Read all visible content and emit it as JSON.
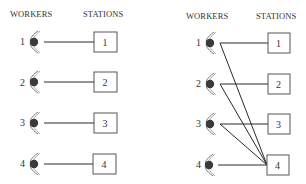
{
  "panels": [
    {
      "id": "left",
      "header_workers": "WORKERS",
      "header_stations": "STATIONS",
      "workers": [
        "1",
        "2",
        "3",
        "4"
      ],
      "stations": [
        "1",
        "2",
        "3",
        "4"
      ],
      "connections": [
        [
          1,
          1
        ],
        [
          2,
          2
        ],
        [
          3,
          3
        ],
        [
          4,
          4
        ]
      ]
    },
    {
      "id": "right",
      "header_workers": "WORKERS",
      "header_stations": "STATIONS",
      "workers": [
        "1",
        "2",
        "3",
        "4"
      ],
      "stations": [
        "1",
        "2",
        "3",
        "4"
      ],
      "connections": [
        [
          1,
          1
        ],
        [
          2,
          2
        ],
        [
          3,
          3
        ],
        [
          4,
          4
        ],
        [
          1,
          4
        ],
        [
          2,
          4
        ],
        [
          3,
          4
        ]
      ]
    }
  ],
  "colors": {
    "line": "#2a2a2a",
    "worker_fill": "#3a3a3a",
    "box_stroke": "#444444",
    "text": "#333333"
  },
  "icons": {
    "worker": "worker-eye-icon",
    "station": "station-box"
  }
}
